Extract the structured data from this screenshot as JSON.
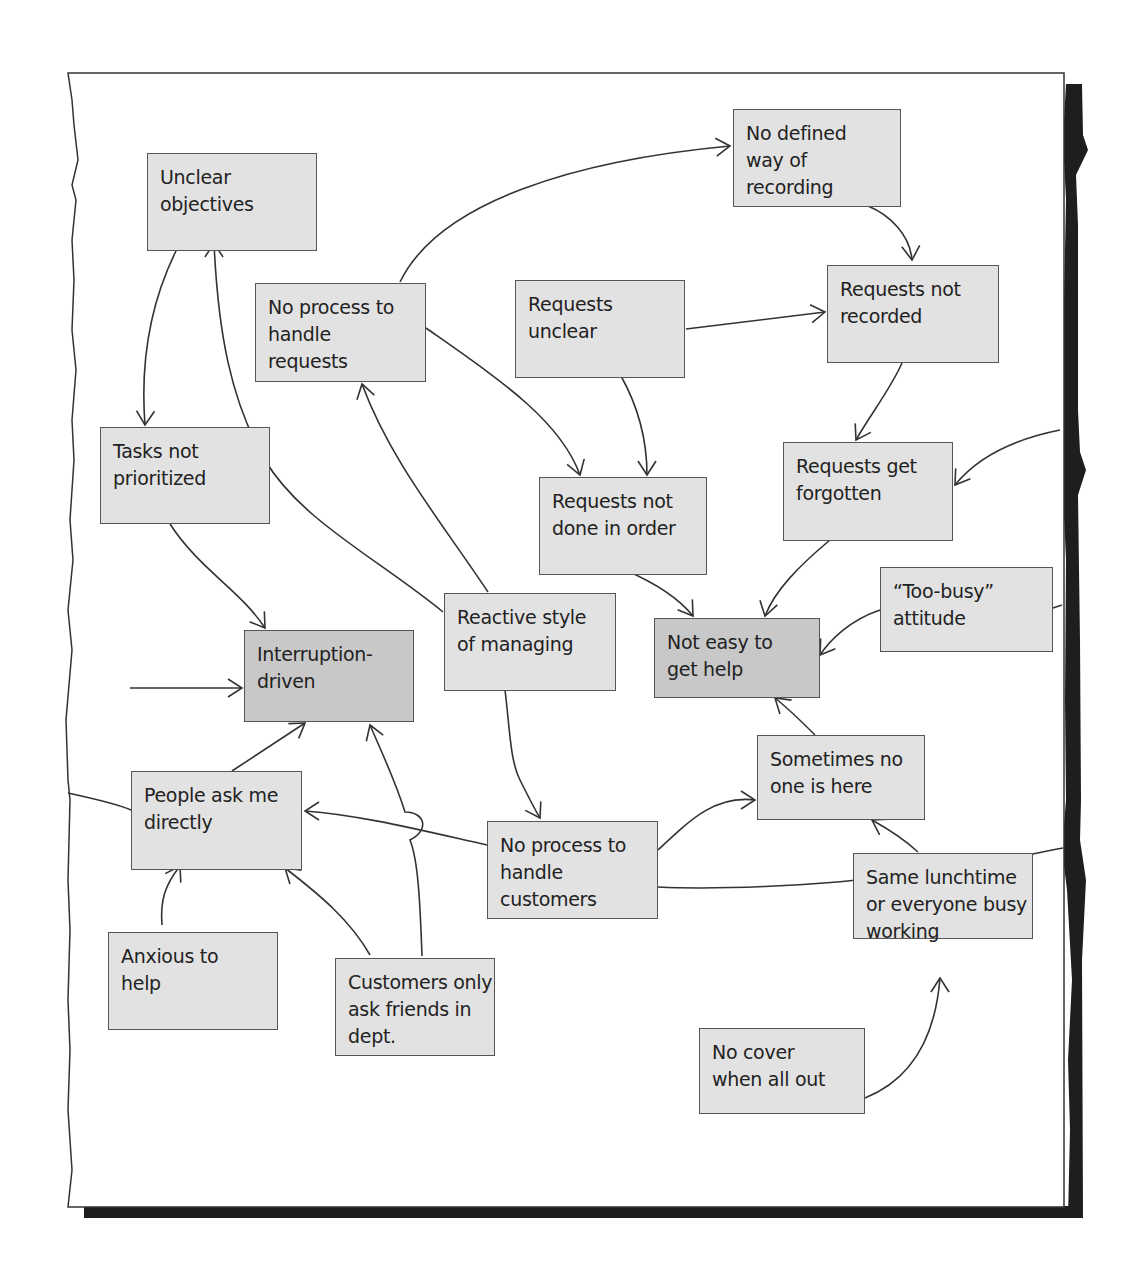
{
  "diagram": {
    "type": "multiple-cause diagram",
    "colors": {
      "paper": "#ffffff",
      "paper_border": "#333333",
      "shadow": "#1e1e1e",
      "node_fill": "#e2e2e2",
      "key_node_fill": "#c8c8c8",
      "node_border": "#555555",
      "arrow": "#333333",
      "text": "#222222"
    },
    "nodes": [
      {
        "id": "unclear_objectives",
        "label": [
          "Unclear",
          "objectives"
        ],
        "x": 147,
        "y": 153,
        "w": 170,
        "h": 98,
        "key": false
      },
      {
        "id": "no_defined_way",
        "label": [
          "No defined",
          "way of",
          "recording"
        ],
        "x": 733,
        "y": 109,
        "w": 168,
        "h": 98,
        "key": false
      },
      {
        "id": "no_process_requests",
        "label": [
          "No process to",
          "handle",
          "requests"
        ],
        "x": 255,
        "y": 283,
        "w": 171,
        "h": 99,
        "key": false
      },
      {
        "id": "requests_unclear",
        "label": [
          "Requests",
          "unclear"
        ],
        "x": 515,
        "y": 280,
        "w": 170,
        "h": 98,
        "key": false
      },
      {
        "id": "requests_not_recorded",
        "label": [
          "Requests not",
          "recorded"
        ],
        "x": 827,
        "y": 265,
        "w": 172,
        "h": 98,
        "key": false
      },
      {
        "id": "tasks_not_prioritized",
        "label": [
          "Tasks not",
          "prioritized"
        ],
        "x": 100,
        "y": 427,
        "w": 170,
        "h": 97,
        "key": false
      },
      {
        "id": "requests_not_done",
        "label": [
          "Requests not",
          "done in order"
        ],
        "x": 539,
        "y": 477,
        "w": 168,
        "h": 98,
        "key": false
      },
      {
        "id": "requests_forgotten",
        "label": [
          "Requests get",
          "forgotten"
        ],
        "x": 783,
        "y": 442,
        "w": 170,
        "h": 99,
        "key": false
      },
      {
        "id": "interruption_driven",
        "label": [
          "Interruption-",
          "driven"
        ],
        "x": 244,
        "y": 630,
        "w": 170,
        "h": 92,
        "key": true
      },
      {
        "id": "reactive_style",
        "label": [
          "Reactive style",
          "of managing"
        ],
        "x": 444,
        "y": 593,
        "w": 172,
        "h": 98,
        "key": false
      },
      {
        "id": "not_easy_help",
        "label": [
          "Not easy to",
          "get help"
        ],
        "x": 654,
        "y": 618,
        "w": 166,
        "h": 80,
        "key": true
      },
      {
        "id": "too_busy",
        "label": [
          "“Too-busy”",
          "attitude"
        ],
        "x": 880,
        "y": 567,
        "w": 173,
        "h": 85,
        "key": false
      },
      {
        "id": "people_ask_directly",
        "label": [
          "People ask me",
          "directly"
        ],
        "x": 131,
        "y": 771,
        "w": 171,
        "h": 99,
        "key": false
      },
      {
        "id": "sometimes_no_one",
        "label": [
          "Sometimes no",
          "one is here"
        ],
        "x": 757,
        "y": 735,
        "w": 168,
        "h": 85,
        "key": false
      },
      {
        "id": "no_process_customers",
        "label": [
          "No process to",
          "handle",
          "customers"
        ],
        "x": 487,
        "y": 821,
        "w": 171,
        "h": 98,
        "key": false
      },
      {
        "id": "same_lunchtime",
        "label": [
          "Same lunchtime",
          "or everyone busy",
          "working"
        ],
        "x": 853,
        "y": 853,
        "w": 180,
        "h": 86,
        "key": false
      },
      {
        "id": "anxious_to_help",
        "label": [
          "Anxious to",
          "help"
        ],
        "x": 108,
        "y": 932,
        "w": 170,
        "h": 98,
        "key": false
      },
      {
        "id": "customers_ask_friends",
        "label": [
          "Customers only",
          "ask friends in",
          "dept."
        ],
        "x": 335,
        "y": 958,
        "w": 160,
        "h": 98,
        "key": false
      },
      {
        "id": "no_cover",
        "label": [
          "No cover",
          "when all out"
        ],
        "x": 699,
        "y": 1028,
        "w": 166,
        "h": 86,
        "key": false
      }
    ],
    "edges": [
      {
        "from": "unclear_objectives",
        "to": "tasks_not_prioritized",
        "path": "M180,243 C150,300 140,360 145,425"
      },
      {
        "from": "reactive_style",
        "to": "unclear_objectives",
        "path": "M443,612 C380,560 300,520 265,460 C230,400 218,330 214,243"
      },
      {
        "from": "no_process_requests",
        "to": "no_defined_way",
        "path": "M400,282 C440,200 580,160 730,146"
      },
      {
        "from": "no_defined_way",
        "to": "requests_not_recorded",
        "path": "M868,206 C890,215 910,235 912,260"
      },
      {
        "from": "requests_unclear",
        "to": "requests_not_recorded",
        "path": "M686,329 L825,312"
      },
      {
        "from": "no_process_requests",
        "to": "requests_not_done",
        "path": "M426,328 C500,380 560,420 580,475"
      },
      {
        "from": "requests_unclear",
        "to": "requests_not_done",
        "path": "M621,376 C640,410 647,445 647,475"
      },
      {
        "from": "requests_not_recorded",
        "to": "requests_forgotten",
        "path": "M902,363 C890,390 870,415 856,440"
      },
      {
        "from": "external_right_top",
        "to": "requests_forgotten",
        "path": "M1060,430 C1010,440 975,460 955,485"
      },
      {
        "from": "reactive_style",
        "to": "no_process_requests",
        "path": "M488,592 C440,520 390,460 362,384"
      },
      {
        "from": "tasks_not_prioritized",
        "to": "interruption_driven",
        "path": "M170,524 C200,570 240,590 265,628"
      },
      {
        "from": "external_left",
        "to": "interruption_driven",
        "path": "M130,688 L242,688"
      },
      {
        "from": "requests_not_done",
        "to": "not_easy_help",
        "path": "M625,570 C660,585 680,600 693,616"
      },
      {
        "from": "requests_forgotten",
        "to": "not_easy_help",
        "path": "M830,540 C800,565 775,590 765,616"
      },
      {
        "from": "too_busy",
        "to": "not_easy_help",
        "path": "M880,610 C850,620 830,640 820,655"
      },
      {
        "from": "external_right_mid",
        "to": "too_busy",
        "path": "M1062,605 L1053,608"
      },
      {
        "from": "people_ask_directly",
        "to": "interruption_driven",
        "path": "M232,771 L305,723"
      },
      {
        "from": "customers_ask_friends",
        "to": "interruption_driven",
        "path": "M422,956 C420,900 418,860 410,840 C430,830 425,812 405,812 C395,780 385,760 370,725"
      },
      {
        "from": "reactive_style",
        "to": "no_process_customers",
        "path": "M505,690 C510,730 510,760 520,780 C530,800 535,810 540,818"
      },
      {
        "from": "no_process_customers",
        "to": "people_ask_directly",
        "path": "M487,845 C420,830 360,815 305,811"
      },
      {
        "from": "external_left_lower",
        "to": "people_ask_directly",
        "path": "M68,793 C100,800 120,805 131,810"
      },
      {
        "from": "anxious_to_help",
        "to": "people_ask_directly",
        "path": "M162,925 C160,900 165,885 180,866"
      },
      {
        "from": "customers_ask_friends",
        "to": "people_ask_directly",
        "path": "M370,955 C350,920 320,895 285,868"
      },
      {
        "from": "no_process_customers",
        "to": "sometimes_no_one",
        "path": "M658,850 C690,820 715,795 755,800"
      },
      {
        "from": "sometimes_no_one",
        "to": "not_easy_help",
        "path": "M815,735 C800,720 790,710 775,698"
      },
      {
        "from": "no_process_customers",
        "to": "external_right_low",
        "path": "M658,887 C720,890 820,885 875,878 C875,865 900,862 915,868 L915,878 C960,870 1010,858 1063,848"
      },
      {
        "from": "same_lunchtime",
        "to": "sometimes_no_one",
        "path": "M918,852 C905,840 890,830 872,820"
      },
      {
        "from": "no_cover",
        "to": "same_lunchtime",
        "path": "M865,1098 C910,1080 935,1040 940,978"
      }
    ],
    "arrowheads": [
      {
        "at": [
          145,
          425
        ],
        "angle": 92
      },
      {
        "at": [
          214,
          243
        ],
        "angle": -90
      },
      {
        "at": [
          730,
          146
        ],
        "angle": -5
      },
      {
        "at": [
          912,
          260
        ],
        "angle": 85
      },
      {
        "at": [
          825,
          312
        ],
        "angle": -7
      },
      {
        "at": [
          580,
          475
        ],
        "angle": 72
      },
      {
        "at": [
          647,
          475
        ],
        "angle": 90
      },
      {
        "at": [
          856,
          440
        ],
        "angle": 120
      },
      {
        "at": [
          955,
          485
        ],
        "angle": 125
      },
      {
        "at": [
          362,
          384
        ],
        "angle": -105
      },
      {
        "at": [
          265,
          628
        ],
        "angle": 55
      },
      {
        "at": [
          242,
          688
        ],
        "angle": 0
      },
      {
        "at": [
          693,
          616
        ],
        "angle": 55
      },
      {
        "at": [
          765,
          616
        ],
        "angle": 105
      },
      {
        "at": [
          820,
          655
        ],
        "angle": 125
      },
      {
        "at": [
          305,
          723
        ],
        "angle": -35
      },
      {
        "at": [
          370,
          725
        ],
        "angle": -110
      },
      {
        "at": [
          540,
          818
        ],
        "angle": 60
      },
      {
        "at": [
          305,
          811
        ],
        "angle": 180
      },
      {
        "at": [
          180,
          866
        ],
        "angle": -60
      },
      {
        "at": [
          285,
          868
        ],
        "angle": -140
      },
      {
        "at": [
          755,
          800
        ],
        "angle": 0
      },
      {
        "at": [
          775,
          698
        ],
        "angle": -140
      },
      {
        "at": [
          872,
          820
        ],
        "angle": -150
      },
      {
        "at": [
          940,
          978
        ],
        "angle": -90
      }
    ]
  }
}
